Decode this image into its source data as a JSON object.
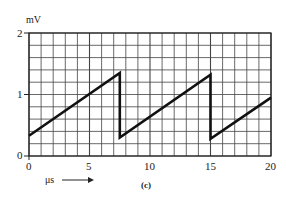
{
  "chart_data": {
    "type": "line",
    "title": "",
    "caption": "(c)",
    "xlabel": "μs",
    "ylabel": "mV",
    "xlim": [
      0,
      20
    ],
    "ylim": [
      0,
      2
    ],
    "x_ticks": [
      "0",
      "5",
      "10",
      "15",
      "20"
    ],
    "y_ticks": [
      "0",
      "1",
      "2"
    ],
    "grid": true,
    "grid_minor_x_step": 1,
    "grid_minor_y_step": 0.2,
    "series": [
      {
        "name": "sawtooth",
        "x": [
          0,
          7.5,
          7.5,
          15,
          15,
          20
        ],
        "y": [
          0.33,
          1.35,
          0.3,
          1.32,
          0.28,
          0.95
        ]
      }
    ]
  },
  "labels": {
    "y_unit": "mV",
    "x_unit": "μs",
    "x_arrow": "⟶",
    "caption": "(c)",
    "ytick_0": "0",
    "ytick_1": "1",
    "ytick_2": "2",
    "xtick_0": "0",
    "xtick_5": "5",
    "xtick_10": "10",
    "xtick_15": "15",
    "xtick_20": "20"
  }
}
